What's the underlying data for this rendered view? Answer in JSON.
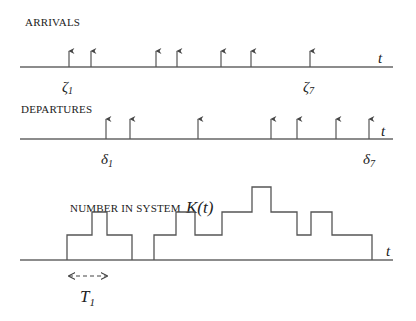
{
  "arrivals": {
    "label": "ARRIVALS",
    "axis_label": "t",
    "axis": {
      "x1": 20,
      "x2": 393,
      "y": 67
    },
    "arrow_top": 48,
    "times_x": [
      69,
      91,
      156,
      177,
      221,
      251,
      310
    ],
    "first_label": {
      "sym": "ζ",
      "sub": "1",
      "x": 62
    },
    "last_label": {
      "sym": "ζ",
      "sub": "7",
      "x": 303
    }
  },
  "departures": {
    "label": "DEPARTURES",
    "axis_label": "t",
    "axis": {
      "x1": 20,
      "x2": 393,
      "y": 139
    },
    "arrow_top": 116,
    "times_x": [
      106,
      130,
      198,
      271,
      297,
      336,
      369
    ],
    "first_label": {
      "sym": "δ",
      "sub": "1",
      "x": 101
    },
    "last_label": {
      "sym": "δ",
      "sub": "7",
      "x": 363
    }
  },
  "number_in_system": {
    "label": "NUMBER IN SYSTEM",
    "func_label": "K(t)",
    "axis_label": "t",
    "axis": {
      "x1": 20,
      "x2": 393,
      "y": 260
    },
    "levels_y": [
      260,
      235,
      212,
      187
    ],
    "segments": [
      [
        [
          67,
          0
        ],
        [
          92,
          1
        ],
        [
          107,
          2
        ],
        [
          132,
          1
        ]
      ],
      [
        [
          154,
          0
        ],
        [
          176,
          1
        ],
        [
          195,
          2
        ],
        [
          222,
          1
        ],
        [
          252,
          2
        ],
        [
          271,
          3
        ],
        [
          297,
          2
        ],
        [
          311,
          1
        ],
        [
          332,
          2
        ],
        [
          372,
          1
        ]
      ]
    ],
    "segment_ends": [
      132,
      372
    ]
  },
  "period": {
    "label": "T",
    "sub": "1",
    "x1": 67,
    "x2": 109,
    "y": 276
  }
}
